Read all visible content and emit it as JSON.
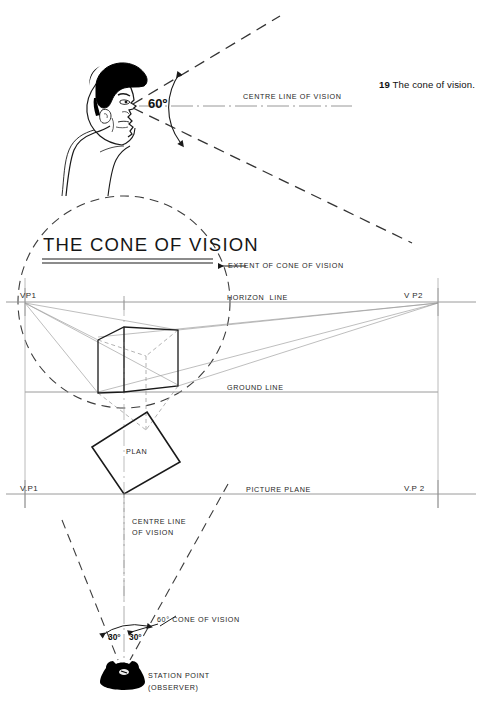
{
  "figure": {
    "caption_number": "19",
    "caption_text": "The cone of vision.",
    "title": "THE CONE OF VISION"
  },
  "upper_diagram": {
    "angle_label": "60º",
    "centre_line_label": "CENTRE LINE OF VISION"
  },
  "perspective_view": {
    "extent_label": "EXTENT OF CONE OF VISION",
    "horizon_label": "HORIZON  LINE",
    "ground_label": "GROUND LINE",
    "vp_left": "VP1",
    "vp_right": "V P2"
  },
  "plan_view": {
    "plan_label": "PLAN",
    "picture_plane_label": "PICTURE PLANE",
    "vp_left": "V.P1",
    "vp_right": "V.P 2",
    "centre_line_label_1": "CENTRE LINE",
    "centre_line_label_2": "OF VISION",
    "cone_label": "60° CONE OF VISION",
    "half_angle_left": "30°",
    "half_angle_right": "30°",
    "station_point_label_1": "STATION POINT",
    "station_point_label_2": "(OBSERVER)"
  },
  "colors": {
    "ink": "#1a1a1a",
    "light_rule": "#9a9a9a",
    "construction": "#8c8c8c",
    "dashed": "#4d4d4d",
    "hair": "#000000"
  }
}
